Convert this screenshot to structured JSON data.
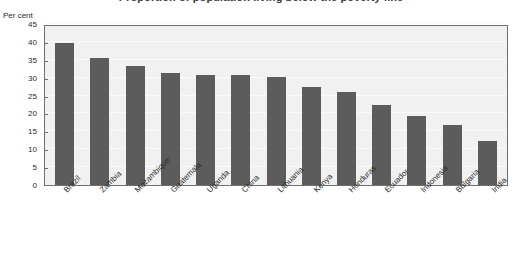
{
  "chart_data": {
    "type": "bar",
    "title": "Proportion of population living below the poverty line",
    "ylabel": "Per cent",
    "xlabel": "",
    "ylim": [
      0,
      45
    ],
    "ytick_values": [
      0,
      5,
      10,
      15,
      20,
      25,
      30,
      35,
      40,
      45
    ],
    "ytick_labels": [
      "0",
      "5",
      "10",
      "15",
      "20",
      "25",
      "30",
      "35",
      "40",
      "45"
    ],
    "grid": true,
    "legend": "none",
    "bar_color": "#5c5c5c",
    "plot_background": "#f1f1f1",
    "categories": [
      "Brazil",
      "Zambia",
      "Mozambique",
      "Guatemala",
      "Uganda",
      "China",
      "Lithuania",
      "Kenya",
      "Honduras",
      "Ecuador",
      "Indonesia",
      "Bulgaria",
      "India"
    ],
    "values": [
      39.8,
      35.6,
      33.4,
      31.2,
      30.8,
      30.7,
      30.2,
      27.3,
      26.1,
      22.3,
      19.4,
      16.7,
      12.3
    ]
  }
}
